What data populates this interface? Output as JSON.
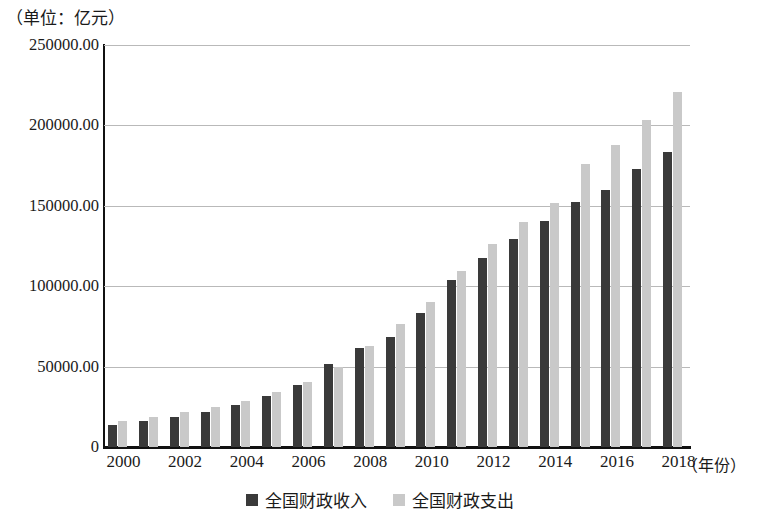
{
  "unit_caption": "（单位：亿元）",
  "axis": {
    "y_ticks": [
      "250000.00",
      "200000.00",
      "150000.00",
      "100000.00",
      "50000.00",
      "0"
    ],
    "x_title": "（年份）",
    "x_ticks": [
      "2000",
      "2002",
      "2004",
      "2006",
      "2008",
      "2010",
      "2012",
      "2014",
      "2016",
      "2018"
    ]
  },
  "legend": {
    "revenue_label": "全国财政收入",
    "expenditure_label": "全国财政支出"
  },
  "colors": {
    "revenue": "#3a3a3a",
    "expenditure": "#c9c9c9",
    "axis": "#111111",
    "grid": "#b9b9b9"
  },
  "chart_data": {
    "type": "bar",
    "title": "",
    "subtitle": "",
    "xlabel": "（年份）",
    "ylabel": "（单位：亿元）",
    "ylim": [
      0,
      250000
    ],
    "ytick_values": [
      0,
      50000,
      100000,
      150000,
      200000,
      250000
    ],
    "grid": true,
    "legend_position": "bottom-center",
    "categories": [
      "2000",
      "2001",
      "2002",
      "2003",
      "2004",
      "2005",
      "2006",
      "2007",
      "2008",
      "2009",
      "2010",
      "2011",
      "2012",
      "2013",
      "2014",
      "2015",
      "2016",
      "2017",
      "2018"
    ],
    "series": [
      {
        "name": "全国财政收入",
        "color": "#3a3a3a",
        "values": [
          13395,
          16386,
          18904,
          21715,
          26396,
          31649,
          38760,
          51322,
          61330,
          68518,
          83102,
          103874,
          117254,
          129210,
          140370,
          152269,
          159605,
          172593,
          183352
        ]
      },
      {
        "name": "全国财政支出",
        "color": "#c9c9c9",
        "values": [
          15887,
          18903,
          22053,
          24650,
          28487,
          33930,
          40423,
          49781,
          62593,
          76300,
          89874,
          109248,
          125953,
          140212,
          151786,
          175878,
          187755,
          203085,
          220906
        ]
      }
    ]
  }
}
